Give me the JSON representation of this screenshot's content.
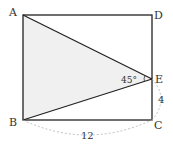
{
  "diagram": {
    "type": "geometry",
    "shape": "rectangle ABCD with triangle ABE",
    "points": {
      "A": {
        "label": "A",
        "x": 23,
        "y": 15
      },
      "B": {
        "label": "B",
        "x": 23,
        "y": 120
      },
      "C": {
        "label": "C",
        "x": 152,
        "y": 120
      },
      "D": {
        "label": "D",
        "x": 152,
        "y": 15
      },
      "E": {
        "label": "E",
        "x": 152,
        "y": 79
      }
    },
    "shaded_region": "triangle ABE",
    "colors": {
      "stroke": "#222222",
      "fill": "#f0f0f0",
      "dashed": "#b0b0b0",
      "text": "#333333"
    },
    "annotations": {
      "angle_AEB": "45°",
      "length_BC": "12",
      "length_EC": "4"
    }
  }
}
